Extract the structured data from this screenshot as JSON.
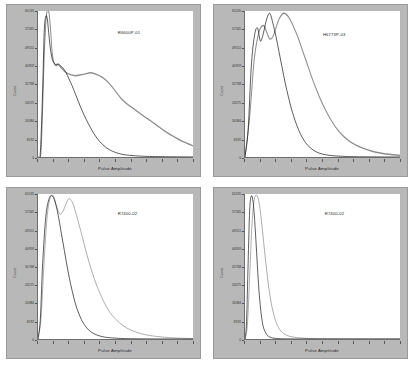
{
  "page": {
    "background_color": "#ffffff",
    "panel_frame_color": "#b8b8b8",
    "plot_background_color": "#ffffff",
    "layout": "2x2-grid-of-histograms"
  },
  "axes": {
    "ylabel": "Count",
    "xlabel": "Pulse Amplitude",
    "ytick_labels": [
      "65535",
      "57345",
      "49151",
      "40959",
      "32768",
      "24575",
      "16384",
      "8192",
      "0"
    ],
    "ytick_values": [
      65535,
      57345,
      49151,
      40959,
      32768,
      24575,
      16384,
      8192,
      0
    ],
    "ylim": [
      0,
      65535
    ],
    "xtick_labels": [],
    "xtick_count": 11,
    "grid": "off"
  },
  "legend": {
    "series_colors": {
      "black": "#111111",
      "gray": "#8c8c8c"
    }
  },
  "chart_data": [
    {
      "type": "line",
      "title": "R6600P-01",
      "xlabel": "Pulse Amplitude",
      "ylabel": "Count",
      "ylim": [
        0,
        65535
      ],
      "xlim": [
        0,
        100
      ],
      "grid": "off",
      "series": [
        {
          "name": "black",
          "color": "#111111",
          "x": [
            0,
            1.5,
            3,
            4,
            5,
            6,
            7,
            8,
            9,
            10,
            11.5,
            13,
            14.5,
            16,
            18,
            20,
            22,
            24,
            26,
            28,
            31,
            34,
            37,
            40,
            44,
            48,
            52,
            56,
            60,
            66,
            72,
            80,
            90,
            100
          ],
          "values": [
            0,
            2000,
            30000,
            56000,
            63000,
            62000,
            55000,
            48500,
            44500,
            42500,
            41500,
            41800,
            41000,
            40000,
            38000,
            35000,
            32000,
            28500,
            25000,
            21500,
            17000,
            13000,
            9500,
            6800,
            4200,
            2600,
            1600,
            1000,
            700,
            400,
            250,
            150,
            80,
            40
          ]
        },
        {
          "name": "gray",
          "color": "#8c8c8c",
          "x": [
            0,
            2,
            4,
            5.5,
            7,
            8,
            9,
            10,
            11.5,
            13,
            15,
            17,
            19,
            21,
            24,
            27,
            30,
            34,
            38,
            42,
            46,
            50,
            54,
            58,
            62,
            66,
            70,
            74,
            78,
            82,
            86,
            90,
            94,
            98,
            100
          ],
          "values": [
            0,
            3000,
            45000,
            64000,
            65000,
            58000,
            48000,
            43000,
            41000,
            41500,
            40000,
            38500,
            37500,
            37000,
            36500,
            36800,
            37200,
            37800,
            37000,
            35500,
            33000,
            29500,
            26000,
            23500,
            21500,
            19500,
            17500,
            15500,
            13500,
            11500,
            9800,
            8200,
            6800,
            5600,
            5000
          ]
        }
      ]
    },
    {
      "type": "line",
      "title": "H6773P-03",
      "xlabel": "Pulse Amplitude",
      "ylabel": "Count",
      "ylim": [
        0,
        65535
      ],
      "xlim": [
        0,
        100
      ],
      "grid": "off",
      "series": [
        {
          "name": "black",
          "color": "#111111",
          "x": [
            0,
            2,
            4,
            6,
            8,
            10,
            12,
            14,
            16,
            18,
            20,
            22,
            24,
            26,
            28,
            30,
            33,
            36,
            39,
            42,
            46,
            50,
            55,
            60,
            66,
            72,
            80,
            90,
            100
          ],
          "values": [
            0,
            12000,
            40000,
            54000,
            58000,
            52000,
            56000,
            62000,
            64500,
            60000,
            54000,
            47000,
            40000,
            33000,
            27000,
            21500,
            15000,
            10000,
            6500,
            4200,
            2300,
            1300,
            700,
            400,
            220,
            130,
            70,
            35,
            15
          ]
        },
        {
          "name": "gray",
          "color": "#8c8c8c",
          "x": [
            0,
            3,
            6,
            9,
            12,
            14,
            16,
            18,
            20,
            22,
            25,
            28,
            31,
            34,
            37,
            40,
            44,
            48,
            52,
            56,
            60,
            64,
            68,
            72,
            76,
            82,
            88,
            94,
            100
          ],
          "values": [
            0,
            18000,
            44000,
            56000,
            59000,
            56000,
            53000,
            54000,
            58000,
            62000,
            64500,
            63000,
            59000,
            54000,
            48000,
            42000,
            34000,
            27000,
            21000,
            16000,
            12000,
            9000,
            6800,
            5200,
            4000,
            2600,
            1700,
            1100,
            700
          ]
        }
      ]
    },
    {
      "type": "line",
      "title": "R7400-02",
      "xlabel": "Pulse Amplitude",
      "ylabel": "Count",
      "ylim": [
        0,
        65535
      ],
      "xlim": [
        0,
        100
      ],
      "grid": "off",
      "series": [
        {
          "name": "black",
          "color": "#111111",
          "x": [
            0,
            1.5,
            3,
            5,
            7,
            9,
            11,
            13,
            15,
            17,
            19,
            21,
            23,
            25,
            28,
            31,
            34,
            38,
            42,
            46,
            52,
            58,
            66,
            76,
            88,
            100
          ],
          "values": [
            0,
            9000,
            34000,
            55000,
            63000,
            64800,
            62000,
            56000,
            48000,
            40000,
            32000,
            25000,
            19000,
            14000,
            8800,
            5400,
            3300,
            1800,
            1000,
            600,
            300,
            160,
            80,
            40,
            20,
            10
          ]
        },
        {
          "name": "gray",
          "color": "#8c8c8c",
          "x": [
            0,
            2,
            4,
            6,
            8,
            10,
            12,
            14,
            16,
            18,
            20,
            22,
            24,
            26,
            29,
            32,
            35,
            38,
            42,
            46,
            50,
            55,
            60,
            66,
            72,
            80,
            88,
            94,
            100
          ],
          "values": [
            0,
            10000,
            36000,
            56000,
            64000,
            64500,
            60000,
            56500,
            57500,
            61000,
            63500,
            62000,
            58000,
            53000,
            45000,
            37000,
            30000,
            24000,
            17500,
            12500,
            9000,
            6000,
            4000,
            2500,
            1600,
            900,
            500,
            320,
            200
          ]
        }
      ]
    },
    {
      "type": "line",
      "title": "R7400-02",
      "xlabel": "Pulse Amplitude",
      "ylabel": "Count",
      "ylim": [
        0,
        65535
      ],
      "xlim": [
        0,
        100
      ],
      "grid": "off",
      "series": [
        {
          "name": "black",
          "color": "#111111",
          "x": [
            0,
            1,
            2,
            3,
            4,
            5,
            6,
            7,
            8,
            9,
            10,
            11,
            12,
            14,
            16,
            18,
            21,
            25,
            30,
            40,
            60,
            100
          ],
          "values": [
            0,
            8000,
            34000,
            58000,
            64500,
            63000,
            56000,
            45000,
            33000,
            22000,
            14000,
            8500,
            5000,
            2000,
            900,
            450,
            200,
            90,
            45,
            20,
            8,
            3
          ]
        },
        {
          "name": "gray",
          "color": "#8c8c8c",
          "x": [
            0,
            1.5,
            3,
            4.5,
            6,
            7.5,
            9,
            10.5,
            12,
            13.5,
            15,
            17,
            19,
            21,
            24,
            28,
            33,
            40,
            50,
            65,
            85,
            100
          ],
          "values": [
            0,
            6000,
            28000,
            52000,
            63000,
            65000,
            62000,
            54000,
            44000,
            34000,
            25000,
            16000,
            10000,
            6000,
            3000,
            1400,
            700,
            300,
            130,
            55,
            22,
            10
          ]
        }
      ]
    }
  ]
}
